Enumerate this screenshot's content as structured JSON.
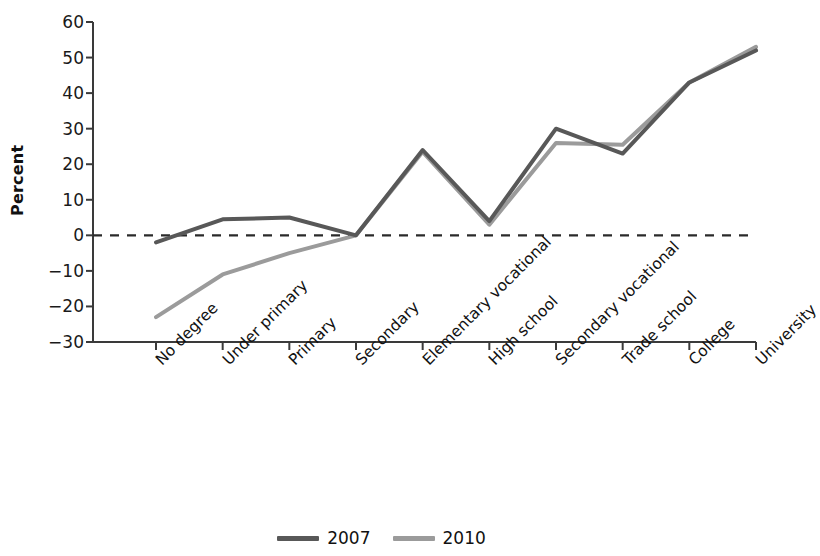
{
  "chart_data": {
    "type": "line",
    "title": "",
    "xlabel": "",
    "ylabel": "Percent",
    "ylim": [
      -30,
      60
    ],
    "yticks": [
      60,
      50,
      40,
      30,
      20,
      10,
      0,
      -10,
      -20,
      -30
    ],
    "ytick_labels": [
      "60",
      "50",
      "40",
      "30",
      "20",
      "10",
      "0",
      "−10",
      "−20",
      "−30"
    ],
    "grid": false,
    "zero_reference_line": true,
    "legend_position": "bottom-center",
    "categories": [
      "No degree",
      "Under primary",
      "Primary",
      "Secondary",
      "Elementary vocational",
      "High school",
      "Secondary vocational",
      "Trade school",
      "College",
      "University"
    ],
    "series": [
      {
        "name": "2007",
        "color": "#585858",
        "values": [
          -2,
          4.5,
          5,
          0,
          24,
          4,
          30,
          23,
          43,
          52
        ]
      },
      {
        "name": "2010",
        "color": "#9b9b9b",
        "values": [
          -23,
          -11,
          -5,
          0,
          23.5,
          3,
          26,
          25.5,
          43,
          53
        ]
      }
    ]
  },
  "axis": {
    "y_label": "Percent"
  },
  "legend": {
    "items": [
      {
        "label": "2007",
        "color": "#585858"
      },
      {
        "label": "2010",
        "color": "#9b9b9b"
      }
    ]
  }
}
